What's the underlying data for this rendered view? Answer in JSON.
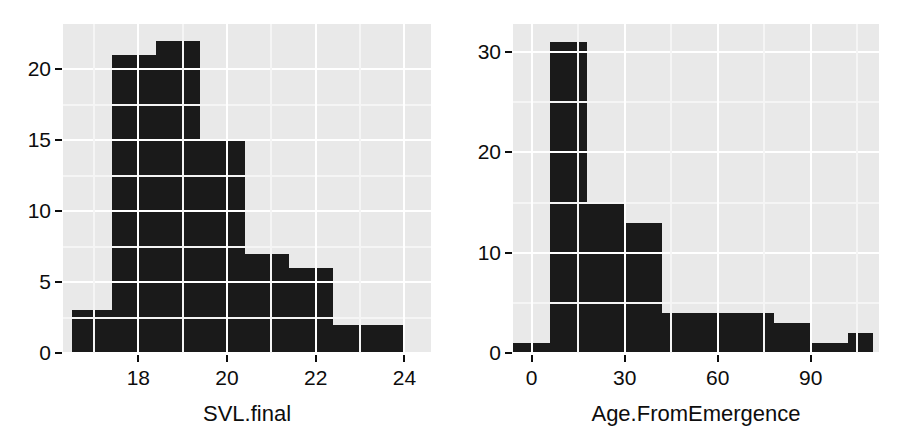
{
  "figure": {
    "background_color": "#ffffff",
    "panel_color": "#e9e9e9",
    "bar_color": "#1a1a1a",
    "grid_major_color": "#ffffff",
    "grid_minor_color": "#f5f5f5"
  },
  "panels": {
    "left": {
      "xlabel": "SVL.final",
      "ylabel": "",
      "x_ticks": [
        "18",
        "20",
        "22",
        "24"
      ],
      "y_ticks": [
        "0",
        "5",
        "10",
        "15",
        "20"
      ]
    },
    "right": {
      "xlabel": "Age.FromEmergence",
      "ylabel": "",
      "x_ticks": [
        "0",
        "30",
        "60",
        "90"
      ],
      "y_ticks": [
        "0",
        "10",
        "20",
        "30"
      ]
    }
  },
  "chart_data": [
    {
      "type": "bar",
      "title": "",
      "xlabel": "SVL.final",
      "ylabel": "",
      "subtitle": "",
      "grid": true,
      "legend": "none",
      "xlim": [
        16.3,
        24.6
      ],
      "ylim": [
        0,
        23.2
      ],
      "x_tick_values": [
        18,
        20,
        22,
        24
      ],
      "y_tick_values": [
        0,
        5,
        10,
        15,
        20
      ],
      "bin_edges": [
        16.5,
        17.4,
        18.4,
        19.4,
        20.4,
        21.4,
        22.4,
        23.4,
        24.0
      ],
      "categories": [
        "16.5-17.4",
        "17.4-18.4",
        "18.4-19.4",
        "19.4-20.4",
        "20.4-21.4",
        "21.4-22.4",
        "22.4-23.4",
        "23.4-24.0"
      ],
      "values": [
        3,
        21,
        22,
        15,
        7,
        6,
        2,
        2
      ]
    },
    {
      "type": "bar",
      "title": "",
      "xlabel": "Age.FromEmergence",
      "ylabel": "",
      "subtitle": "",
      "grid": true,
      "legend": "none",
      "xlim": [
        -6,
        112
      ],
      "ylim": [
        0,
        32.8
      ],
      "x_tick_values": [
        0,
        30,
        60,
        90
      ],
      "y_tick_values": [
        0,
        10,
        20,
        30
      ],
      "bin_edges": [
        -6,
        6,
        18,
        30,
        42,
        54,
        66,
        78,
        90,
        102,
        110
      ],
      "categories": [
        "-6-6",
        "6-18",
        "18-30",
        "30-42",
        "42-54",
        "54-66",
        "66-78",
        "78-90",
        "90-102",
        "102-110"
      ],
      "values": [
        1,
        31,
        15,
        13,
        4,
        4,
        4,
        3,
        1,
        2
      ]
    }
  ]
}
